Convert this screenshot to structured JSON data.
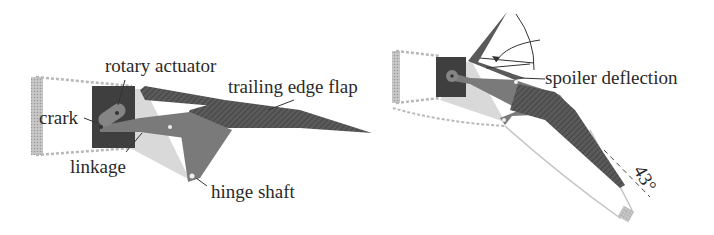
{
  "diagram": {
    "type": "flap-spoiler mechanism schematic",
    "panels": [
      {
        "id": "left",
        "description": "Trailing edge flap mechanism (neutral)",
        "labels": {
          "rotary_actuator": "rotary actuator",
          "trailing_edge_flap": "trailing edge flap",
          "crark": "crark",
          "linkage": "linkage",
          "hinge_shaft": "hinge shaft"
        }
      },
      {
        "id": "right",
        "description": "Deflected configuration",
        "labels": {
          "spoiler_deflection": "spoiler deflection",
          "angle": "43°"
        }
      }
    ],
    "colors": {
      "actuator": "#3d3d3d",
      "flap": "#5e5e5e",
      "linkage": "#7a7a7a",
      "bracket": "#d6d6d6",
      "wing_outline": "#bdbdbd",
      "hatch": "#9a9a9a",
      "text": "#2a2a2a"
    }
  }
}
